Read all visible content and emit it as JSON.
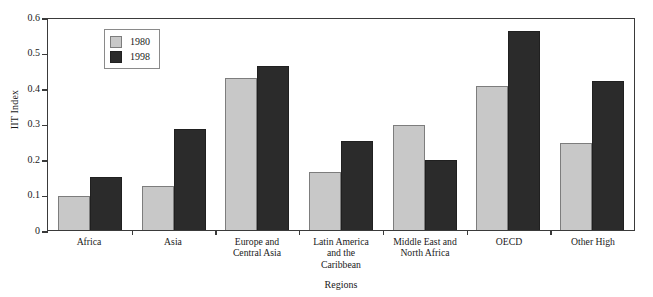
{
  "chart_data": {
    "type": "bar",
    "title": "",
    "xlabel": "Regions",
    "ylabel": "IIT Index",
    "ylim": [
      0,
      0.6
    ],
    "ytick_values": [
      0,
      0.1,
      0.2,
      0.3,
      0.4,
      0.5,
      0.6
    ],
    "ytick_labels": [
      "0",
      "0.1",
      "0.2",
      "0.3",
      "0.4",
      "0.5",
      "0.6"
    ],
    "grid": false,
    "legend_position": "top-left inside",
    "categories": [
      "Africa",
      "Asia",
      "Europe and Central Asia",
      "Latin America and the Caribbean",
      "Middle East and North Africa",
      "OECD",
      "Other High"
    ],
    "category_lines": [
      [
        "Africa"
      ],
      [
        "Asia"
      ],
      [
        "Europe and",
        "Central Asia"
      ],
      [
        "Latin America",
        "and the",
        "Caribbean"
      ],
      [
        "Middle East and",
        "North Africa"
      ],
      [
        "OECD"
      ],
      [
        "Other High"
      ]
    ],
    "series": [
      {
        "name": "1980",
        "color": "#c8c8c8",
        "values": [
          0.097,
          0.124,
          0.428,
          0.163,
          0.297,
          0.405,
          0.245
        ]
      },
      {
        "name": "1998",
        "color": "#2b2b2b",
        "values": [
          0.148,
          0.285,
          0.462,
          0.25,
          0.198,
          0.562,
          0.42
        ]
      }
    ]
  },
  "legend": {
    "entries": [
      {
        "label": "1980",
        "swatch": "swatch-1980"
      },
      {
        "label": "1998",
        "swatch": "swatch-1998"
      }
    ]
  }
}
